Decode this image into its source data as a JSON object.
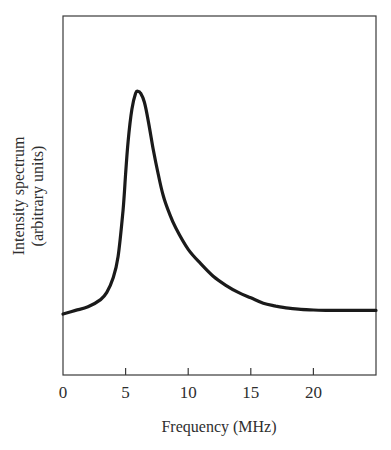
{
  "chart_data": {
    "type": "line",
    "title": "",
    "xlabel": "Frequency (MHz)",
    "ylabel_line1": "Intensity spectrum",
    "ylabel_line2": "(arbitrary units)",
    "ylabel": "Intensity spectrum (arbitrary units)",
    "xlim": [
      0,
      25
    ],
    "ylim": [
      0,
      1
    ],
    "x_ticks": [
      0,
      5,
      10,
      15,
      20
    ],
    "x_tick_labels": [
      "0",
      "5",
      "10",
      "15",
      "20"
    ],
    "y_ticks": [],
    "grid": false,
    "legend": null,
    "series": [
      {
        "name": "Intensity spectrum",
        "x": [
          0,
          1,
          2,
          3,
          3.5,
          4,
          4.4,
          4.8,
          5.0,
          5.2,
          5.5,
          5.8,
          6.0,
          6.2,
          6.5,
          6.8,
          7.2,
          7.6,
          8.0,
          8.5,
          9,
          10,
          11,
          12,
          13,
          14,
          15,
          16,
          17,
          18,
          19,
          20,
          21,
          22,
          23,
          24,
          25
        ],
        "y": [
          0.17,
          0.18,
          0.19,
          0.21,
          0.23,
          0.27,
          0.33,
          0.46,
          0.56,
          0.65,
          0.74,
          0.785,
          0.79,
          0.785,
          0.76,
          0.71,
          0.63,
          0.56,
          0.5,
          0.45,
          0.41,
          0.35,
          0.31,
          0.275,
          0.25,
          0.23,
          0.215,
          0.2,
          0.192,
          0.186,
          0.183,
          0.181,
          0.18,
          0.18,
          0.18,
          0.18,
          0.18
        ]
      }
    ],
    "line_color": "#1a1a1a"
  },
  "labels": {
    "x_axis_title": "Frequency (MHz)",
    "y_axis_title_line1": "Intensity spectrum",
    "y_axis_title_line2": "(arbitrary units)",
    "tick_0": "0",
    "tick_5": "5",
    "tick_10": "10",
    "tick_15": "15",
    "tick_20": "20"
  }
}
